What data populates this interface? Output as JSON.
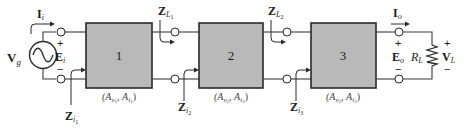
{
  "source": {
    "label": "V",
    "sub": "g"
  },
  "input": {
    "current": {
      "label": "I",
      "sub": "i"
    },
    "voltage": {
      "label": "E",
      "sub": "i"
    },
    "plus": "+",
    "minus": "−"
  },
  "stages": [
    {
      "number": "1",
      "gain_label": "(A",
      "av_sub": "v",
      "av_sub2": "1",
      "ai": "A",
      "ai_sub": "i",
      "ai_sub2": "1",
      "zi": {
        "label": "Z",
        "sub": "i",
        "sub2": "1"
      }
    },
    {
      "number": "2",
      "gain_label": "(A",
      "av_sub": "v",
      "av_sub2": "2",
      "ai": "A",
      "ai_sub": "i",
      "ai_sub2": "2",
      "zi": {
        "label": "Z",
        "sub": "i",
        "sub2": "2"
      }
    },
    {
      "number": "3",
      "gain_label": "(A",
      "av_sub": "v",
      "av_sub2": "3",
      "ai": "A",
      "ai_sub": "i",
      "ai_sub2": "3",
      "zi": {
        "label": "Z",
        "sub": "i",
        "sub2": "3"
      }
    }
  ],
  "load_impedances": [
    {
      "label": "Z",
      "sub": "L",
      "sub2": "1"
    },
    {
      "label": "Z",
      "sub": "L",
      "sub2": "2"
    }
  ],
  "output": {
    "current": {
      "label": "I",
      "sub": "o"
    },
    "voltage": {
      "label": "E",
      "sub": "o"
    },
    "load_resistor": {
      "label": "R",
      "sub": "L"
    },
    "load_voltage": {
      "label": "V",
      "sub": "L"
    },
    "plus": "+",
    "minus": "−"
  },
  "colors": {
    "block_fill": "#b9b9b9",
    "line": "#2a2a2a",
    "background": "#ffffff"
  }
}
